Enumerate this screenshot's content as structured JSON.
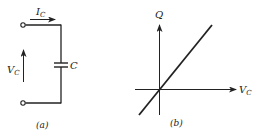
{
  "figure": {
    "panel_a": {
      "caption": "(a)",
      "current_label": "I",
      "current_sub": "C",
      "voltage_label": "V",
      "voltage_sub": "C",
      "capacitor_label": "C",
      "components": [
        "top-terminal",
        "bottom-terminal",
        "capacitor",
        "current-arrow",
        "voltage-arrow"
      ]
    },
    "panel_b": {
      "caption": "(b)",
      "y_axis_label": "Q",
      "x_axis_label": "V",
      "x_axis_sub": "C",
      "relation": "Q proportional to V_C (straight line through origin)"
    },
    "colors": {
      "ink": "#222222",
      "background": "#ffffff"
    }
  }
}
